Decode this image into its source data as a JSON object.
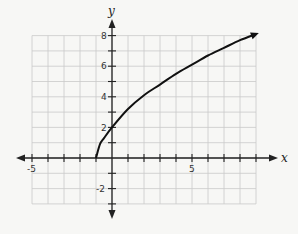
{
  "chart_data": {
    "type": "line",
    "title": "",
    "xlabel": "x",
    "ylabel": "y",
    "xlim": [
      -5,
      9
    ],
    "ylim": [
      -3,
      8
    ],
    "grid": true,
    "x_tick_labels": [
      "-5",
      "5"
    ],
    "y_tick_labels": [
      "8",
      "6",
      "4",
      "2",
      "-2"
    ],
    "series": [
      {
        "name": "curve",
        "x": [
          -1,
          -0.75,
          -0.5,
          0,
          1,
          2,
          3,
          4,
          5,
          6,
          7,
          8,
          9
        ],
        "y": [
          0,
          0.9,
          1.3,
          2,
          3.2,
          4.1,
          4.8,
          5.5,
          6.1,
          6.7,
          7.2,
          7.7,
          8.1
        ]
      }
    ],
    "annotations": [
      "curve starts at (-1, 0)",
      "arrow at right end of curve"
    ]
  },
  "labels": {
    "x_axis": "x",
    "y_axis": "y",
    "x_neg5": "-5",
    "x_5": "5",
    "y_8": "8",
    "y_6": "6",
    "y_4": "4",
    "y_2": "2",
    "y_neg2": "-2"
  }
}
